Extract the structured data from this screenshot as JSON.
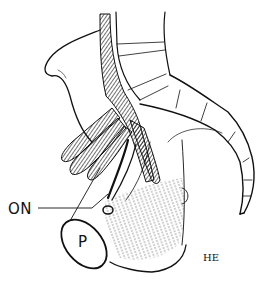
{
  "figure": {
    "type": "anatomical line illustration",
    "labels": {
      "optic_nerve": "ON",
      "pituitary": "P"
    },
    "signature": "HE",
    "colors": {
      "ink": "#111111",
      "background": "#ffffff"
    }
  }
}
